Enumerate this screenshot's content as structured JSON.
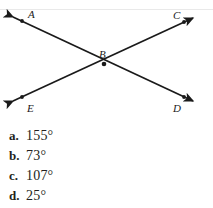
{
  "figure": {
    "type": "two-intersecting-lines",
    "intersection_label": "B",
    "points": [
      {
        "id": "A",
        "label": "A",
        "x": 22,
        "y": 20,
        "label_x": 28,
        "label_y": 17
      },
      {
        "id": "C",
        "label": "C",
        "x": 184,
        "y": 22,
        "label_x": 176,
        "label_y": 18
      },
      {
        "id": "B",
        "label": "B",
        "x": 104,
        "y": 64,
        "label_x": 100,
        "label_y": 57
      },
      {
        "id": "E",
        "label": "E",
        "x": 22,
        "y": 96,
        "label_x": 27,
        "label_y": 110
      },
      {
        "id": "D",
        "label": "D",
        "x": 184,
        "y": 96,
        "label_x": 175,
        "label_y": 110
      }
    ],
    "lines": [
      {
        "id": "line-AD",
        "from": "A",
        "through": "B",
        "to": "D",
        "x1": 13,
        "y1": 17,
        "x2": 193,
        "y2": 101
      },
      {
        "id": "line-EC",
        "from": "E",
        "through": "B",
        "to": "C",
        "x1": 13,
        "y1": 101,
        "x2": 193,
        "y2": 18
      }
    ],
    "arrow_tips": [
      {
        "id": "arrow-A",
        "x": 10,
        "y": 15
      },
      {
        "id": "arrow-C",
        "x": 196,
        "y": 16
      },
      {
        "id": "arrow-E",
        "x": 10,
        "y": 102
      },
      {
        "id": "arrow-D",
        "x": 196,
        "y": 103
      }
    ],
    "stroke_color": "#1a1a1a"
  },
  "answers": {
    "options": [
      {
        "letter": "a.",
        "value": "155°"
      },
      {
        "letter": "b.",
        "value": "73°"
      },
      {
        "letter": "c.",
        "value": "107°"
      },
      {
        "letter": "d.",
        "value": "25°"
      }
    ]
  }
}
